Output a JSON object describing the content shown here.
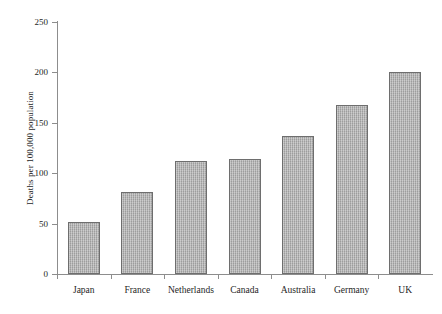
{
  "chart_data": {
    "type": "bar",
    "title": "",
    "xlabel": "",
    "ylabel": "Deaths per 100,000 population",
    "categories": [
      "Japan",
      "France",
      "Netherlands",
      "Canada",
      "Australia",
      "Germany",
      "UK"
    ],
    "values": [
      52,
      81,
      112,
      114,
      137,
      168,
      200
    ],
    "ylim": [
      0,
      250
    ],
    "ytick_labels": [
      "0",
      "50",
      "100",
      "150",
      "200",
      "250"
    ],
    "ytick_values": [
      0,
      50,
      100,
      150,
      200,
      250
    ],
    "grid": false,
    "legend": null,
    "bar_color": "#a9a9a9",
    "bar_border_color": "#6e6e6e",
    "axis_color": "#8d8d8d",
    "text_color": "#262626",
    "background": "#ffffff"
  }
}
